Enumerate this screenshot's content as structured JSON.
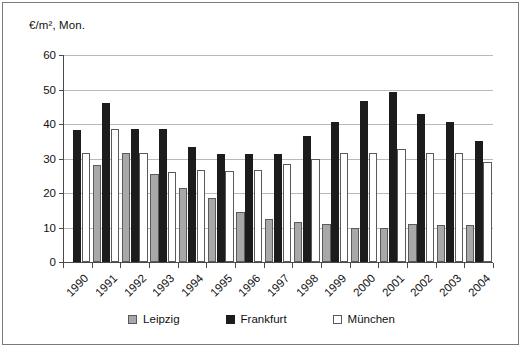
{
  "chart_data": {
    "type": "bar",
    "title": "",
    "subtitle": "",
    "xlabel": "",
    "ylabel": "€/m², Mon.",
    "ylim": [
      0,
      60
    ],
    "ytick_step": 10,
    "yticks": [
      "0",
      "10",
      "20",
      "30",
      "40",
      "50",
      "60"
    ],
    "grid": true,
    "legend_position": "bottom-center",
    "categories": [
      "1990",
      "1991",
      "1992",
      "1993",
      "1994",
      "1995",
      "1996",
      "1997",
      "1998",
      "1999",
      "2000",
      "2001",
      "2002",
      "2003",
      "2004"
    ],
    "series": [
      {
        "name": "Leipzig",
        "color": "#a8a8a8",
        "values": [
          null,
          28.0,
          31.5,
          25.5,
          21.5,
          18.5,
          14.5,
          12.5,
          11.5,
          11.0,
          9.8,
          9.8,
          11.0,
          10.8,
          10.8
        ]
      },
      {
        "name": "Frankfurt",
        "color": "#1c1c1c",
        "values": [
          38.3,
          46.2,
          38.6,
          38.6,
          33.3,
          31.4,
          31.2,
          31.4,
          36.4,
          40.6,
          46.6,
          49.4,
          42.8,
          40.6,
          35.2
        ]
      },
      {
        "name": "München",
        "color": "#ffffff",
        "values": [
          31.5,
          38.5,
          31.5,
          26.0,
          26.8,
          26.5,
          26.8,
          28.3,
          30.0,
          31.5,
          31.5,
          32.7,
          31.5,
          31.5,
          29.0
        ]
      }
    ]
  },
  "axis": {
    "y_unit_label": "€/m², Mon."
  },
  "legend": {
    "items": [
      {
        "label": "Leipzig",
        "swatch": "legend-swatch-leipzig"
      },
      {
        "label": "Frankfurt",
        "swatch": "legend-swatch-frankfurt"
      },
      {
        "label": "München",
        "swatch": "legend-swatch-muenchen"
      }
    ]
  }
}
